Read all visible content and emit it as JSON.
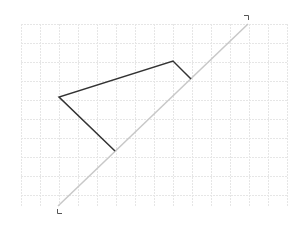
{
  "diagram": {
    "colors": {
      "background": "#ffffff",
      "grid": "#e6e6e6",
      "diagonal_line": "#c8c8c8",
      "shape_stroke": "#333333",
      "corner_marks": "#555555"
    },
    "grid": {
      "x0": 21,
      "y0": 24,
      "x1": 287,
      "y1": 207,
      "step": 19
    },
    "diagonal_line": {
      "x1": 58,
      "y1": 206,
      "x2": 248,
      "y2": 24
    },
    "shape_path": [
      [
        115,
        151
      ],
      [
        59,
        97
      ],
      [
        173,
        61
      ],
      [
        191,
        79
      ]
    ],
    "corner_marks": {
      "top_right": {
        "x": 248,
        "y": 15
      },
      "bottom_left": {
        "x": 57,
        "y": 214
      }
    }
  }
}
